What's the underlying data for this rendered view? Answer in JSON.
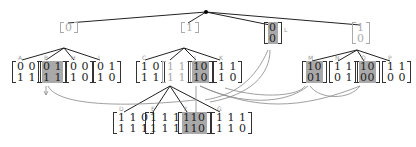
{
  "diagram": {
    "type": "tree",
    "root": {
      "x": 206,
      "y": 12
    },
    "level1": [
      {
        "id": "n0",
        "rows": [
          "0"
        ],
        "x": 190,
        "y": 25,
        "style": "light"
      },
      {
        "id": "n1",
        "rows": [
          "1"
        ],
        "x": 182,
        "y": 25,
        "style": "light"
      },
      {
        "id": "L",
        "label": "L",
        "rows": [
          "0",
          "0"
        ],
        "x": 267,
        "y": 26,
        "style": "shaded"
      },
      {
        "id": "n3",
        "rows": [
          "1",
          "0"
        ],
        "x": 357,
        "y": 26,
        "style": "light"
      }
    ],
    "level2": [
      {
        "id": "A",
        "label": "A",
        "rows": [
          "0 0",
          "1 1"
        ],
        "x": 14,
        "y": 60,
        "style": "plain"
      },
      {
        "id": "B",
        "label": "B",
        "rows": [
          "0 1",
          "1 1"
        ],
        "x": 40,
        "y": 60,
        "style": "shaded"
      },
      {
        "id": "H",
        "label": "H",
        "rows": [
          "0 0",
          "1 0"
        ],
        "x": 66,
        "y": 60,
        "style": "plain"
      },
      {
        "id": "I",
        "label": "I",
        "rows": [
          "0 1",
          "1 0"
        ],
        "x": 93,
        "y": 60,
        "style": "plain"
      },
      {
        "id": "C",
        "label": "C",
        "rows": [
          "1 0",
          "1 1"
        ],
        "x": 137,
        "y": 60,
        "style": "plain"
      },
      {
        "id": "Cx",
        "label": "",
        "rows": [
          "1 1",
          "1 1"
        ],
        "x": 163,
        "y": 60,
        "style": "light"
      },
      {
        "id": "J",
        "label": "J",
        "rows": [
          "10",
          "10"
        ],
        "x": 189,
        "y": 60,
        "style": "shaded"
      },
      {
        "id": "K",
        "label": "K",
        "rows": [
          "1 1",
          "1 0"
        ],
        "x": 213,
        "y": 60,
        "style": "plain"
      },
      {
        "id": "M",
        "label": "M",
        "rows": [
          "10",
          "01"
        ],
        "x": 304,
        "y": 60,
        "style": "shaded"
      },
      {
        "id": "N",
        "label": "N",
        "rows": [
          "1 1",
          "0 1"
        ],
        "x": 330,
        "y": 60,
        "style": "plain"
      },
      {
        "id": "O",
        "label": "O",
        "rows": [
          "10",
          "00"
        ],
        "x": 357,
        "y": 60,
        "style": "shaded"
      },
      {
        "id": "P",
        "label": "P",
        "rows": [
          "1 1",
          "0 0"
        ],
        "x": 383,
        "y": 60,
        "style": "plain"
      }
    ],
    "level3": [
      {
        "id": "D",
        "label": "D",
        "rows": [
          "1 1 0",
          "1 1 1"
        ],
        "x": 116,
        "y": 112,
        "style": "plain"
      },
      {
        "id": "E",
        "label": "E",
        "rows": [
          "1 1 1",
          "1 1 1"
        ],
        "x": 146,
        "y": 112,
        "style": "plain"
      },
      {
        "id": "F",
        "label": "F",
        "rows": [
          "110",
          "110"
        ],
        "x": 180,
        "y": 112,
        "style": "shaded"
      },
      {
        "id": "G",
        "label": "G",
        "rows": [
          "1 1 1",
          "1 1 0"
        ],
        "x": 213,
        "y": 112,
        "style": "plain"
      }
    ],
    "edge_color": "#222",
    "arrow_color": "#888",
    "shade_color": "#a9a9a9"
  }
}
